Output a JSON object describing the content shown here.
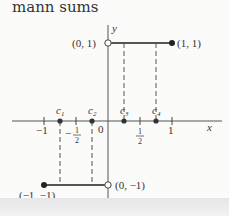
{
  "caption": "mann sums",
  "figure": {
    "axes": {
      "x_label": "x",
      "y_label": "y",
      "origin_label": "0"
    },
    "x_ticks": [
      {
        "value": -1,
        "label": "−1"
      },
      {
        "value": -0.5,
        "label_neg": "−",
        "label_num": "1",
        "label_den": "2"
      },
      {
        "value": 0.5,
        "label_num": "1",
        "label_den": "2"
      },
      {
        "value": 1,
        "label": "1"
      }
    ],
    "sample_points": [
      {
        "name": "c",
        "sub": "1",
        "x": -0.75
      },
      {
        "name": "c",
        "sub": "2",
        "x": -0.25
      },
      {
        "name": "c",
        "sub": "3",
        "x": 0.25
      },
      {
        "name": "c",
        "sub": "4",
        "x": 0.75
      }
    ],
    "segments": [
      {
        "from": [
          0,
          1
        ],
        "to": [
          1,
          1
        ],
        "open_end": "(0, 1)",
        "closed_end": "(1, 1)"
      },
      {
        "from": [
          -1,
          -1
        ],
        "to": [
          0,
          -1
        ],
        "open_end": "(0, −1)",
        "closed_end": "(−1, −1)"
      }
    ],
    "point_labels": {
      "p01": "(0, 1)",
      "p11": "(1, 1)",
      "p0m1": "(0, −1)",
      "pm1m1": "(−1, −1)"
    }
  }
}
